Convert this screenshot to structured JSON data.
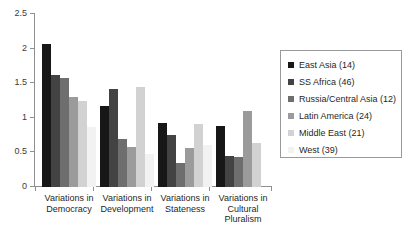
{
  "chart_data": {
    "type": "bar",
    "title": "",
    "subtitle": "",
    "xlabel": "",
    "ylabel": "",
    "ylim": [
      0,
      2.5
    ],
    "ytick_labels": [
      "0",
      "0.5",
      "1",
      "1.5",
      "2",
      "2.5"
    ],
    "ytick_values": [
      0,
      0.5,
      1,
      1.5,
      2,
      2.5
    ],
    "grid": false,
    "legend_position": "right",
    "categories": [
      "Variations in Democracy",
      "Variations in Development",
      "Variations in Stateness",
      "Variations in Cultural Pluralism"
    ],
    "category_lines": [
      [
        "Variations in",
        "Democracy"
      ],
      [
        "Variations in",
        "Development"
      ],
      [
        "Variations in",
        "Stateness"
      ],
      [
        "Variations in",
        "Cultural",
        "Pluralism"
      ]
    ],
    "series": [
      {
        "name": "East Asia (14)",
        "color": "#171717",
        "values": [
          2.07,
          1.17,
          0.93,
          0.88
        ]
      },
      {
        "name": "SS Africa (46)",
        "color": "#434343",
        "values": [
          1.62,
          1.41,
          0.75,
          0.45
        ]
      },
      {
        "name": "Russia/Central Asia (12)",
        "color": "#6e6e6e",
        "values": [
          1.57,
          0.69,
          0.34,
          0.44
        ]
      },
      {
        "name": "Latin America (24)",
        "color": "#9b9b9b",
        "values": [
          1.3,
          0.58,
          0.56,
          1.1
        ]
      },
      {
        "name": "Middle East (21)",
        "color": "#d2d2d2",
        "values": [
          1.25,
          1.45,
          0.91,
          0.63
        ]
      },
      {
        "name": "West (39)",
        "color": "#f2f2f2",
        "values": [
          0.87,
          0.48,
          0.61,
          0.0
        ]
      }
    ]
  },
  "legend": {
    "items": [
      {
        "label": "East Asia (14)",
        "swatch": "#171717"
      },
      {
        "label": "SS Africa (46)",
        "swatch": "#434343"
      },
      {
        "label": "Russia/Central Asia (12)",
        "swatch": "#6e6e6e"
      },
      {
        "label": "Latin America (24)",
        "swatch": "#9b9b9b"
      },
      {
        "label": "Middle East (21)",
        "swatch": "#d2d2d2"
      },
      {
        "label": "West (39)",
        "swatch": "#f2f2f2"
      }
    ]
  },
  "axis": {
    "y_labels": [
      "2.5",
      "2",
      "1.5",
      "1",
      "0.5",
      "0"
    ],
    "axis_color": "#8f8f8f"
  }
}
